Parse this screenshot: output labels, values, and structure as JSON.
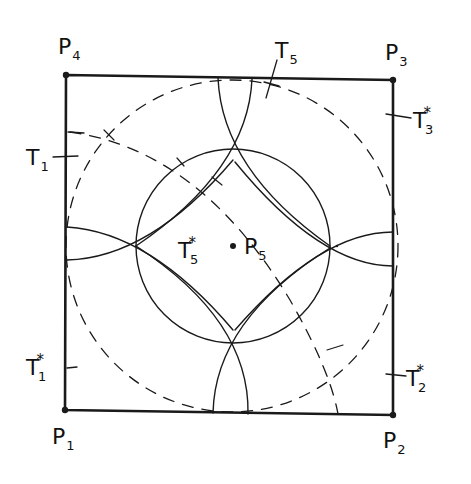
{
  "diagram": {
    "title": "",
    "colors": {
      "stroke": "#1a1a1a",
      "background": "#ffffff"
    },
    "points": {
      "P1": {
        "label": "P",
        "sub": "1",
        "x": 65,
        "y": 410
      },
      "P2": {
        "label": "P",
        "sub": "2",
        "x": 393,
        "y": 415
      },
      "P3": {
        "label": "P",
        "sub": "3",
        "x": 393,
        "y": 80
      },
      "P4": {
        "label": "P",
        "sub": "4",
        "x": 66,
        "y": 75
      },
      "P5": {
        "label": "P",
        "sub": "5",
        "x": 233,
        "y": 246
      }
    },
    "tick_labels": {
      "T1": {
        "label": "T",
        "sub": "1",
        "star": ""
      },
      "T1s": {
        "label": "T",
        "sub": "1",
        "star": "*"
      },
      "T2s": {
        "label": "T",
        "sub": "2",
        "star": "*"
      },
      "T3s": {
        "label": "T",
        "sub": "3",
        "star": "*"
      },
      "T5": {
        "label": "T",
        "sub": "5",
        "star": ""
      },
      "T5s": {
        "label": "T",
        "sub": "5",
        "star": "*"
      }
    },
    "shapes": {
      "square": "P1-P2-P3-P4 (solid, thick)",
      "inner_circle": "centered at P5, solid",
      "outer_circle": "centered at P5, dashed",
      "lens_arcs": "four pairs of solid arcs (top, bottom, left, right)",
      "dashed_curve": "from left edge near T1 sweeping to bottom edge"
    }
  }
}
